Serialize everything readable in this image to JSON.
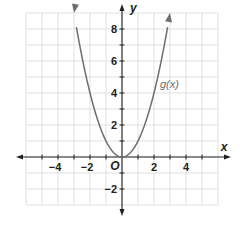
{
  "chart_data": {
    "type": "line",
    "title": "",
    "xlabel": "x",
    "ylabel": "y",
    "origin_label": "O",
    "xlim": [
      -6,
      6
    ],
    "ylim": [
      -3,
      9
    ],
    "grid": true,
    "x_tick_labels": [
      {
        "value": -4,
        "label": "−4"
      },
      {
        "value": -2,
        "label": "−2"
      },
      {
        "value": 2,
        "label": "2"
      },
      {
        "value": 4,
        "label": "4"
      }
    ],
    "y_tick_labels": [
      {
        "value": 8,
        "label": "8"
      },
      {
        "value": 6,
        "label": "6"
      },
      {
        "value": 4,
        "label": "4"
      },
      {
        "value": 2,
        "label": "2"
      },
      {
        "value": -2,
        "label": "−2"
      }
    ],
    "series": [
      {
        "name": "g(x)",
        "label": "g(x)",
        "function": "x^2",
        "domain": [
          -3,
          3
        ],
        "arrows_at_ends": true,
        "x": [
          -3,
          -2,
          -1,
          0,
          1,
          2,
          3
        ],
        "values": [
          9,
          4,
          1,
          0,
          1,
          4,
          9
        ],
        "color": "#6d6e71"
      }
    ],
    "legend": "inline label near (2.5, 4.5)"
  },
  "colors": {
    "grid": "#d9d9d9",
    "axis": "#231f20",
    "curve": "#6d6e71"
  }
}
